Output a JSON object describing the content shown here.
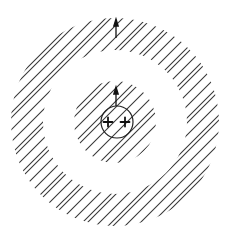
{
  "diagram": {
    "center": [
      115,
      122
    ],
    "outer_ring": {
      "outer_radius": 104,
      "inner_radius": 72
    },
    "inner_disk": {
      "radius": 41
    },
    "small_circle": {
      "center": [
        117,
        122
      ],
      "radius": 16
    },
    "charges": [
      {
        "symbol": "+",
        "position": [
          108,
          122
        ]
      },
      {
        "symbol": "+",
        "position": [
          125,
          122
        ]
      }
    ],
    "arrows": [
      {
        "name": "inner-arrow",
        "from": [
          116,
          106
        ],
        "to": [
          116,
          87
        ]
      },
      {
        "name": "outer-arrow",
        "from": [
          116,
          38
        ],
        "to": [
          116,
          19
        ]
      }
    ],
    "hatch": {
      "angle_deg": 45,
      "spacing": 10,
      "color": "#3a3a3a"
    },
    "line_color": "#222222",
    "background": "#ffffff"
  }
}
